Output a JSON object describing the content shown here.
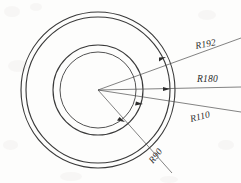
{
  "drawing": {
    "title": "Concentric circles radius dimension drawing",
    "background_color": "#fdfdfc",
    "line_color": "#3a3a3a",
    "label_color": "#2b2b2b",
    "center": {
      "x": 98,
      "y": 90
    },
    "circles": [
      {
        "name": "outermost-circle",
        "label": "R192",
        "rx": 77,
        "ry": 78
      },
      {
        "name": "outer-inner-circle",
        "label": "R180",
        "rx": 72,
        "ry": 73
      },
      {
        "name": "middle-circle",
        "label": "R110",
        "rx": 45,
        "ry": 45
      },
      {
        "name": "innermost-circle",
        "label": "R90",
        "rx": 38,
        "ry": 38
      }
    ],
    "dimensions": [
      {
        "id": "r192",
        "label": "R192",
        "label_x": 196,
        "label_y": 49,
        "rotation": -11,
        "arrow_x": 166,
        "arrow_y": 57,
        "leader_end_x": 241,
        "leader_end_y": 38
      },
      {
        "id": "r180",
        "label": "R180",
        "label_x": 197,
        "label_y": 82,
        "rotation": 0,
        "arrow_x": 170,
        "arrow_y": 89,
        "leader_end_x": 241,
        "leader_end_y": 87
      },
      {
        "id": "r110",
        "label": "R110",
        "label_x": 191,
        "label_y": 122,
        "rotation": -14,
        "arrow_x": 143,
        "arrow_y": 104,
        "leader_end_x": 241,
        "leader_end_y": 112
      },
      {
        "id": "r90",
        "label": "R90",
        "label_x": 153,
        "label_y": 164,
        "rotation": -52,
        "arrow_x": 125,
        "arrow_y": 122,
        "leader_end_x": 172,
        "leader_end_y": 173
      }
    ]
  }
}
